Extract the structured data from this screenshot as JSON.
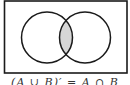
{
  "diagram": {
    "type": "venn",
    "universe_frame": {
      "x": 4,
      "y": 1,
      "width": 123,
      "height": 72
    },
    "sets": [
      {
        "name": "A",
        "cx": 47,
        "cy": 37.5,
        "r": 25.5
      },
      {
        "name": "B",
        "cx": 85,
        "cy": 37.5,
        "r": 25.5
      }
    ],
    "shaded_region": "intersection",
    "colors": {
      "stroke": "#1a1a1a",
      "shade": "#d6d6d6",
      "background": "#ffffff"
    }
  },
  "caption": "(A ∪ B)′ = A ∩ B"
}
